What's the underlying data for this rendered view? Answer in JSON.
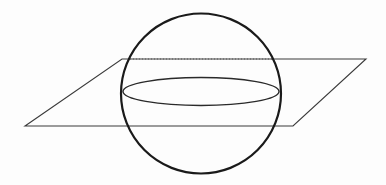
{
  "figure": {
    "width": 386,
    "height": 185,
    "background_color": "#fdfdfd"
  },
  "geometry": {
    "sphere": {
      "label": "sphere-outline",
      "center_x": 201,
      "center_y": 93.5,
      "radius": 80,
      "stroke_color": "#1a1a1a",
      "stroke_width": 2.2,
      "fill": "none"
    },
    "plane": {
      "label": "cutting-plane",
      "points": "122,59 366,59 293,126 25,126",
      "stroke_color": "#3a3a3a",
      "stroke_width": 1.1,
      "fill": "none",
      "corners": [
        {
          "name": "back-left",
          "x": 122,
          "y": 59
        },
        {
          "name": "back-right",
          "x": 366,
          "y": 59
        },
        {
          "name": "front-right",
          "x": 293,
          "y": 126
        },
        {
          "name": "front-left",
          "x": 25,
          "y": 126
        }
      ]
    },
    "intersection_ellipse": {
      "label": "cross-section-circle",
      "center_x": 201,
      "center_y": 91.5,
      "radius_x": 78,
      "radius_y": 14,
      "stroke_color": "#2a2a2a",
      "stroke_width": 1.4,
      "fill": "none"
    },
    "hidden_edge": {
      "label": "hidden-back-edge",
      "x1": 130,
      "y1": 59,
      "x2": 272,
      "y2": 59,
      "stroke_color": "#555555",
      "stroke_width": 1.1,
      "dash_pattern": "1 2"
    }
  }
}
